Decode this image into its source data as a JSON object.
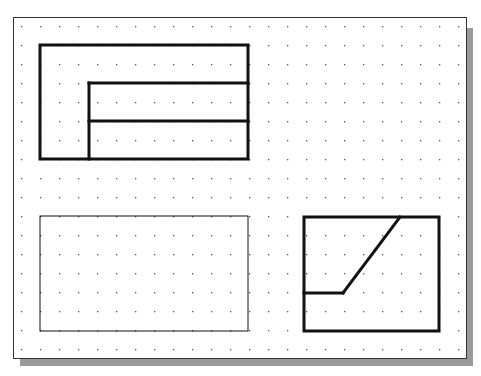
{
  "grid": {
    "x0": 21,
    "y0": 26,
    "spacing": 19,
    "cols": 24,
    "rows": 18,
    "dot_color": "#555555"
  },
  "frame": {
    "x": 13,
    "y": 17,
    "w": 453,
    "h": 341,
    "shadow_color": "#9a9a9a"
  },
  "views": [
    {
      "name": "top-view",
      "stroke_width": 3,
      "rects": [
        {
          "x": 40,
          "y": 45,
          "w": 208,
          "h": 114
        }
      ],
      "lines": [
        {
          "x1": 89,
          "y1": 83,
          "x2": 89,
          "y2": 159
        },
        {
          "x1": 89,
          "y1": 83,
          "x2": 248,
          "y2": 83
        },
        {
          "x1": 89,
          "y1": 121,
          "x2": 248,
          "y2": 121
        }
      ]
    },
    {
      "name": "front-view-blank",
      "stroke_width": 1,
      "rects": [
        {
          "x": 40,
          "y": 216,
          "w": 208,
          "h": 115
        }
      ],
      "lines": []
    },
    {
      "name": "side-view",
      "stroke_width": 3,
      "rects": [
        {
          "x": 304,
          "y": 217,
          "w": 135,
          "h": 114
        }
      ],
      "lines": [
        {
          "x1": 304,
          "y1": 293,
          "x2": 343,
          "y2": 293
        },
        {
          "x1": 343,
          "y1": 293,
          "x2": 400,
          "y2": 217
        }
      ]
    }
  ]
}
